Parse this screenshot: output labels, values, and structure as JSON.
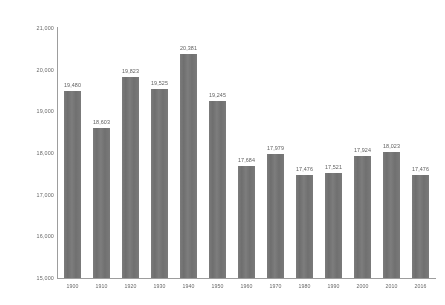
{
  "chart_data": {
    "type": "bar",
    "title": "",
    "subtitle": "",
    "xlabel": "",
    "ylabel": "",
    "grid": false,
    "legend": "none",
    "categories": [
      "1900",
      "1910",
      "1920",
      "1930",
      "1940",
      "1950",
      "1960",
      "1970",
      "1980",
      "1990",
      "2000",
      "2010",
      "2016"
    ],
    "values": [
      19480,
      18603,
      19823,
      19525,
      20381,
      19245,
      17684,
      17979,
      17476,
      17521,
      17924,
      18023,
      17476
    ],
    "value_labels": [
      "19,480",
      "18,603",
      "19,823",
      "19,525",
      "20,381",
      "19,245",
      "17,684",
      "17,979",
      "17,476",
      "17,521",
      "17,924",
      "18,023",
      "17,476"
    ],
    "ylim": [
      15000,
      21000
    ],
    "yticks": [
      21000,
      20000,
      19000,
      18000,
      17000,
      16000,
      15000
    ],
    "ytick_labels": [
      "21,000",
      "20,000",
      "19,000",
      "18,000",
      "17,000",
      "16,000",
      "15,000"
    ],
    "bar_color": "#6d6d6d",
    "axis_color": "#9a9a9a",
    "label_color": "#555555"
  }
}
